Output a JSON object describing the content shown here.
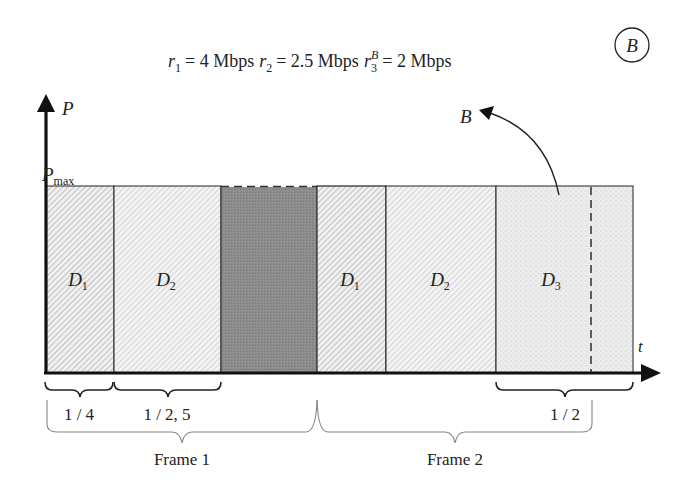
{
  "badge": {
    "label": "B"
  },
  "rates": {
    "r1": {
      "sym": "r",
      "sub": "1",
      "value": "= 4 Mbps"
    },
    "r2": {
      "sym": "r",
      "sub": "2",
      "value": "= 2.5 Mbps"
    },
    "r3": {
      "sym": "r",
      "sub": "3",
      "sup": "B",
      "value": "= 2 Mbps"
    }
  },
  "axes": {
    "y_label": "P",
    "pmax_label": "P",
    "pmax_sub": "max",
    "x_label": "t"
  },
  "callout": {
    "label": "B"
  },
  "blocks": [
    {
      "id": "f1-d1",
      "label": "D",
      "sub": "1",
      "fill": "hatch"
    },
    {
      "id": "f1-d2",
      "label": "D",
      "sub": "2",
      "fill": "hatch-light"
    },
    {
      "id": "gap",
      "label": "",
      "sub": "",
      "fill": "dark"
    },
    {
      "id": "f2-d1",
      "label": "D",
      "sub": "1",
      "fill": "hatch"
    },
    {
      "id": "f2-d2",
      "label": "D",
      "sub": "2",
      "fill": "hatch-light"
    },
    {
      "id": "f2-d3",
      "label": "D",
      "sub": "3",
      "fill": "dotted"
    }
  ],
  "braces": {
    "b1": "1 / 4",
    "b2": "1 / 2, 5",
    "b3": "1 / 2",
    "frame1": "Frame 1",
    "frame2": "Frame 2"
  },
  "colors": {
    "line": "#1a1a1a",
    "dark_block": "#8a8a8a",
    "dotted_block": "#e9e9e9",
    "hatch_bg": "#f2f2f2",
    "hatch_line": "#9a9a9a"
  }
}
